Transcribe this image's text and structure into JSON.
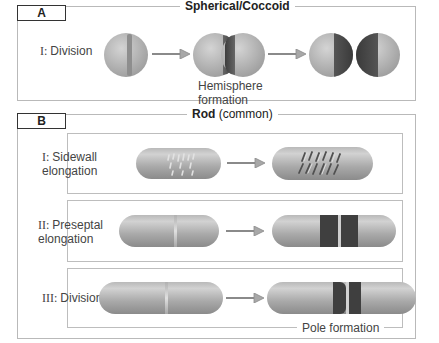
{
  "panel_a": {
    "label": "A",
    "title": "Spherical/Coccoid",
    "steps": [
      {
        "label_roman": "I:",
        "label_text": "Division"
      }
    ],
    "caption_line1": "Hemisphere",
    "caption_line2": "formation"
  },
  "panel_b": {
    "label": "B",
    "title_bold": "Rod",
    "title_rest": " (common)",
    "steps": [
      {
        "label_roman": "I:",
        "label_line1": "Sidewall",
        "label_line2": "elongation"
      },
      {
        "label_roman": "II:",
        "label_line1": "Preseptal",
        "label_line2": "elongation"
      },
      {
        "label_roman": "III:",
        "label_line1": "Division",
        "label_line2": ""
      }
    ],
    "caption": "Pole formation"
  },
  "colors": {
    "cell_light": "#c8c8c8",
    "cell_dark": "#4a4a4a",
    "border": "#b9b9b9",
    "arrow": "#8a8a8a"
  }
}
